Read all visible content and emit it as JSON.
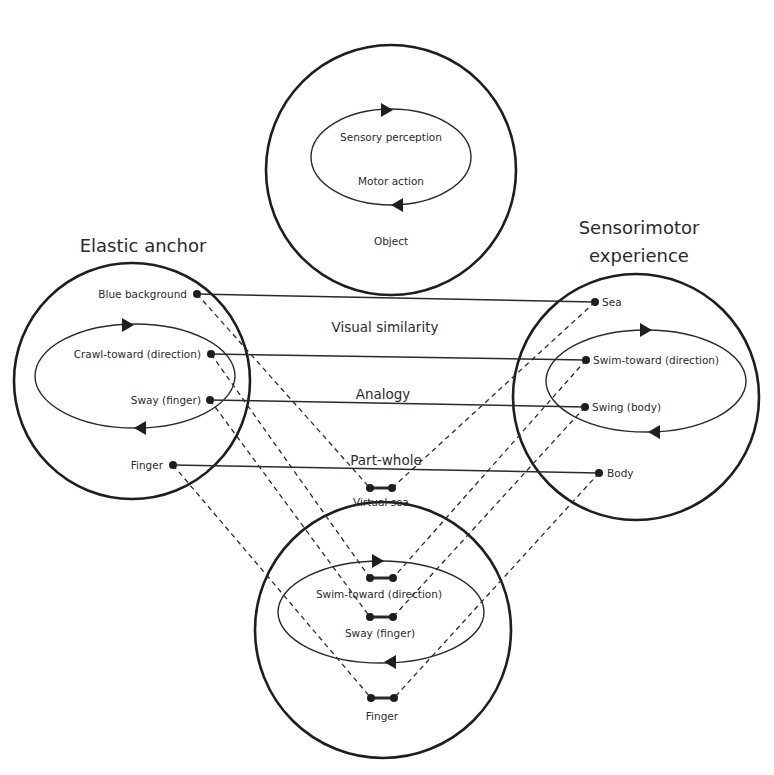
{
  "top_space": {
    "label": "Object",
    "loop_upper": "Sensory perception",
    "loop_lower": "Motor action"
  },
  "left_space": {
    "title": "Elastic anchor",
    "items": [
      "Blue background",
      "Crawl-toward (direction)",
      "Sway (finger)",
      "Finger"
    ]
  },
  "right_space": {
    "title_line1": "Sensorimotor",
    "title_line2": "experience",
    "items": [
      "Sea",
      "Swim-toward (direction)",
      "Swing (body)",
      "Body"
    ]
  },
  "blend_space": {
    "items": [
      "Virtual sea",
      "Swim-toward (direction)",
      "Sway (finger)",
      "Finger"
    ]
  },
  "relations": [
    "Visual similarity",
    "Analogy",
    "Part-whole"
  ],
  "colors": {
    "stroke": "#1e1e1e",
    "text": "#2a2a2a",
    "background": "#ffffff"
  }
}
